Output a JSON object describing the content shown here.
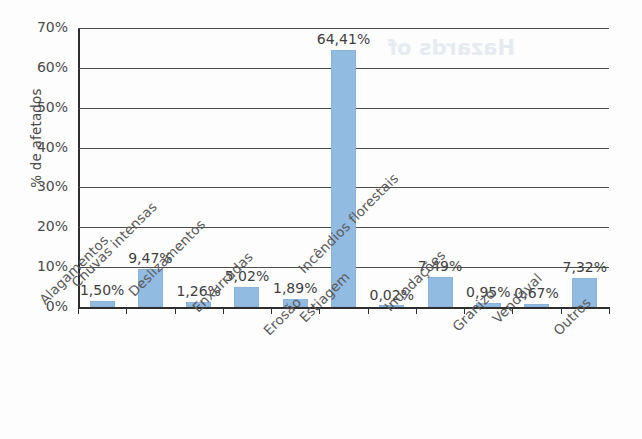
{
  "chart_data": {
    "type": "bar",
    "title": "",
    "xlabel": "",
    "ylabel": "% de afetados",
    "ylim": [
      0,
      70
    ],
    "ytick_labels": [
      "70%",
      "60%",
      "50%",
      "40%",
      "30%",
      "20%",
      "10%",
      "0%"
    ],
    "ytick_values": [
      70,
      60,
      50,
      40,
      30,
      20,
      10,
      0
    ],
    "grid": true,
    "legend": "none",
    "categories": [
      "Alagamentos",
      "Chuvas intensas",
      "Deslizamentos",
      "Enxurradas",
      "Erosão",
      "Estiagem",
      "Incêndios florestais",
      "Inundações",
      "Granizo",
      "Vendaval",
      "Outros"
    ],
    "values": [
      1.5,
      9.47,
      1.26,
      5.02,
      1.89,
      64.41,
      0.02,
      7.49,
      0.95,
      0.67,
      7.32
    ],
    "value_labels": [
      "1,50%",
      "9,47%",
      "1,26%",
      "5,02%",
      "1,89%",
      "64,41%",
      "0,02%",
      "7,49%",
      "0,95%",
      "0,67%",
      "7,32%"
    ],
    "bar_color": "#92bbe2",
    "axis_color": "#2e2e2e",
    "text_color": "#4a4a4a"
  },
  "artifact": {
    "bleed_text": "Hazards of"
  }
}
